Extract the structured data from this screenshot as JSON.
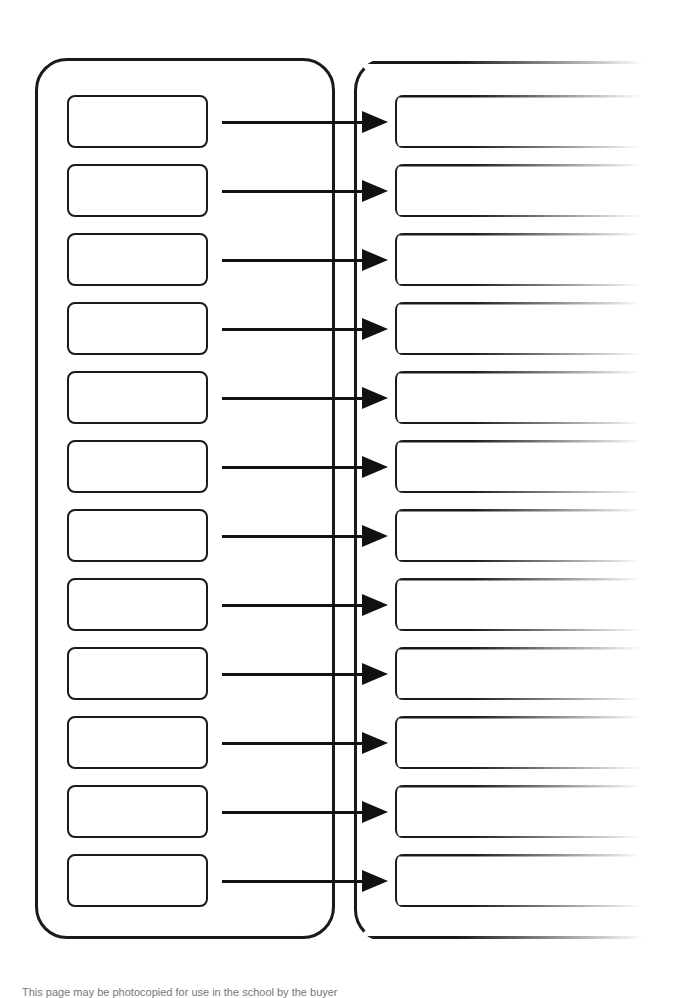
{
  "diagram": {
    "type": "matching-worksheet",
    "left_panel": {
      "label": "",
      "boxes": [
        "",
        "",
        "",
        "",
        "",
        "",
        "",
        "",
        "",
        "",
        "",
        ""
      ]
    },
    "right_panel": {
      "label": "",
      "boxes": [
        "",
        "",
        "",
        "",
        "",
        "",
        "",
        "",
        "",
        "",
        "",
        ""
      ],
      "fades_right": true
    },
    "connectors": {
      "count": 12,
      "style": "arrow",
      "direction": "left-to-right"
    },
    "colors": {
      "stroke": "#1a1a1a",
      "background": "#ffffff"
    }
  },
  "footer": {
    "text": "This page may be photocopied for use in the school by the buyer"
  }
}
